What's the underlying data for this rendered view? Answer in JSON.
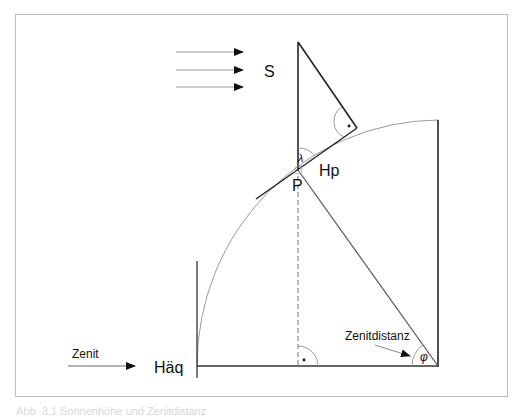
{
  "diagram": {
    "labels": {
      "sun": "S",
      "point": "P",
      "tangent_plane": "Hp",
      "equator_plane": "Häq",
      "zenith": "Zenit",
      "zenith_distance": "Zenitdistanz",
      "lambda": "λ",
      "phi": "φ"
    },
    "right_angle_marker": "·",
    "caption": "Abb. 3.1 Sonnenhöhe und Zenitdistanz"
  }
}
